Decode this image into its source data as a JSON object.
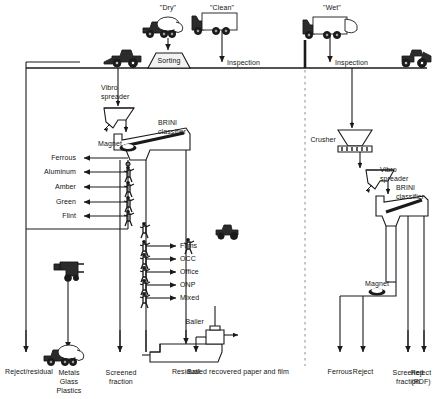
{
  "diagram": {
    "line_color": "#1a1a1a",
    "dashed_divider_color": "#9a9a9a",
    "background": "#ffffff"
  },
  "intake": {
    "streams": [
      {
        "name": "dry-stream",
        "label": "\"Dry\"",
        "vehicle": "collection-truck-icon"
      },
      {
        "name": "clean-stream",
        "label": "\"Clean\"",
        "vehicle": "box-truck-icon"
      },
      {
        "name": "wet-stream",
        "label": "\"Wet\"",
        "vehicle": "tipping-truck-icon"
      }
    ],
    "ground_units": [
      {
        "name": "sorting-station",
        "label": "Sorting"
      },
      {
        "name": "inspection-clean",
        "label": "Inspection"
      },
      {
        "name": "inspection-wet",
        "label": "Inspection"
      }
    ],
    "loaders": [
      {
        "name": "front-loader-left",
        "icon": "wheel-loader-icon"
      },
      {
        "name": "front-loader-right",
        "icon": "wheel-loader-icon"
      }
    ]
  },
  "equipment": {
    "left": [
      {
        "name": "vibro-spreader-left",
        "label": "Vibro\nspreader"
      },
      {
        "name": "brini-classifier-left",
        "label": "BRINI\nclassifier"
      },
      {
        "name": "magnet-left",
        "label": "Magnet"
      }
    ],
    "right": [
      {
        "name": "crusher",
        "label": "Crusher"
      },
      {
        "name": "vibro-spreader-right",
        "label": "Vibro\nspreader"
      },
      {
        "name": "brini-classifier-right",
        "label": "BRINI\nclassifier"
      },
      {
        "name": "magnet-right",
        "label": "Magnet"
      }
    ],
    "bailer": {
      "name": "bailer",
      "label": "Bailer"
    }
  },
  "sorting_picks": {
    "container_picks": [
      {
        "name": "pick-ferrous",
        "label": "Ferrous",
        "worker": "magnet-drum-icon"
      },
      {
        "name": "pick-aluminum",
        "label": "Aluminum",
        "worker": "picker-icon"
      },
      {
        "name": "pick-amber",
        "label": "Amber",
        "worker": "picker-icon"
      },
      {
        "name": "pick-green",
        "label": "Green",
        "worker": "picker-icon"
      },
      {
        "name": "pick-flint",
        "label": "Flint",
        "worker": "picker-icon"
      }
    ],
    "paper_picks": [
      {
        "name": "pick-films",
        "label": "Films",
        "worker": "picker-icon"
      },
      {
        "name": "pick-occ",
        "label": "OCC",
        "worker": "picker-icon"
      },
      {
        "name": "pick-office",
        "label": "Office",
        "worker": "picker-icon"
      },
      {
        "name": "pick-onp",
        "label": "ONP",
        "worker": "picker-icon"
      },
      {
        "name": "pick-mixed",
        "label": "Mixed",
        "worker": "picker-icon"
      }
    ]
  },
  "outputs": [
    {
      "name": "output-reject-residual",
      "label": "Reject/residual"
    },
    {
      "name": "output-metals-glass-plastics",
      "label": "Metals\nGlass\nPlastics"
    },
    {
      "name": "output-screened-fraction-left",
      "label": "Screened\nfraction"
    },
    {
      "name": "output-residual",
      "label": "Residual"
    },
    {
      "name": "output-bailed-paper",
      "label": "Bailed recovered paper and film"
    },
    {
      "name": "output-ferrous",
      "label": "Ferrous"
    },
    {
      "name": "output-reject",
      "label": "Reject"
    },
    {
      "name": "output-screened-fraction-right",
      "label": "Screened\nfraction"
    },
    {
      "name": "output-reject-rdf",
      "label": "Reject\n(RDF)"
    }
  ]
}
